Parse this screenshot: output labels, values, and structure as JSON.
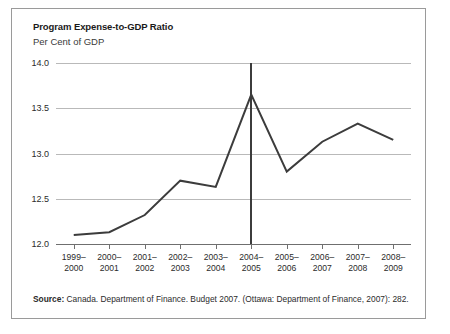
{
  "figure": {
    "title": "Program Expense-to-GDP Ratio",
    "subtitle": "Per Cent of GDP",
    "source_label": "Source:",
    "source_text": " Canada. Department of Finance. Budget 2007. (Ottawa: Department of Finance, 2007): 282."
  },
  "chart_data": {
    "type": "line",
    "title": "Program Expense-to-GDP Ratio",
    "subtitle": "Per Cent of GDP",
    "xlabel": "",
    "ylabel": "Per Cent of GDP",
    "ylim": [
      12.0,
      14.0
    ],
    "yticks": [
      12.0,
      12.5,
      13.0,
      13.5,
      14.0
    ],
    "ytick_labels": [
      "12.0",
      "12.5",
      "13.0",
      "13.5",
      "14.0"
    ],
    "grid": true,
    "legend": "none",
    "line_color": "#3c3c3c",
    "categories": [
      "1999-2000",
      "2000-2001",
      "2001-2002",
      "2002-2003",
      "2003-2004",
      "2004-2005",
      "2005-2006",
      "2006-2007",
      "2007-2008",
      "2008-2009"
    ],
    "tick_labels": [
      [
        "1999–",
        "2000"
      ],
      [
        "2000–",
        "2001"
      ],
      [
        "2001–",
        "2002"
      ],
      [
        "2002–",
        "2003"
      ],
      [
        "2003–",
        "2004"
      ],
      [
        "2004–",
        "2005"
      ],
      [
        "2005–",
        "2006"
      ],
      [
        "2006–",
        "2007"
      ],
      [
        "2007–",
        "2008"
      ],
      [
        "2008–",
        "2009"
      ]
    ],
    "values": [
      12.1,
      12.13,
      12.32,
      12.7,
      12.63,
      13.65,
      12.8,
      13.13,
      13.33,
      13.15
    ],
    "annotations": [
      {
        "type": "vertical-line",
        "at_category": "2004-2005",
        "from": 12.0,
        "to": 14.0,
        "color": "#3c3c3c"
      }
    ]
  }
}
